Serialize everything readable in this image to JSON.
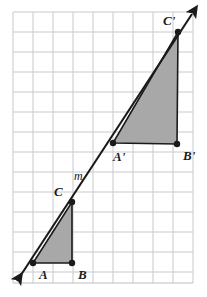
{
  "figure": {
    "canvas": {
      "width": 207,
      "height": 297
    },
    "colors": {
      "grid_line": "#c9c9cf",
      "grid_border": "#bcbcc4",
      "shade_fill": "#a8a8a8",
      "stroke": "#1a1a1a",
      "background": "#ffffff"
    },
    "grid": {
      "x0": 13,
      "y0": 12,
      "cell": 20,
      "cols": 9,
      "rows": 13.55,
      "show_border": true
    },
    "line": {
      "name": "m",
      "label": "m",
      "label_x": 74,
      "label_y": 180,
      "start_x": 17,
      "start_y": 281,
      "end_x": 192,
      "end_y": 14,
      "arrow_both_ends": true,
      "stroke_width": 2.1
    },
    "points": [
      {
        "id": "A",
        "label": "A",
        "x": 33,
        "y": 263,
        "dot": true,
        "label_x": 39,
        "label_y": 279
      },
      {
        "id": "B",
        "label": "B",
        "x": 72,
        "y": 263,
        "dot": true,
        "label_x": 78,
        "label_y": 279
      },
      {
        "id": "C",
        "label": "C",
        "x": 72,
        "y": 202,
        "dot": true,
        "label_x": 54,
        "label_y": 196
      },
      {
        "id": "A'",
        "label": "A'",
        "x": 113,
        "y": 143,
        "dot": true,
        "label_x": 113,
        "label_y": 161
      },
      {
        "id": "B'",
        "label": "B'",
        "x": 177,
        "y": 144,
        "dot": true,
        "label_x": 183,
        "label_y": 160
      },
      {
        "id": "C'",
        "label": "C'",
        "x": 178,
        "y": 32,
        "dot": true,
        "label_x": 163,
        "label_y": 25
      }
    ],
    "triangles": [
      {
        "id": "ABC",
        "name": "triangle-abc",
        "points": "33,263 72,263 72,202",
        "filled": true
      },
      {
        "id": "A'B'C'",
        "name": "triangle-a-prime-b-prime-c-prime",
        "points": "113,143 177,144 178,32",
        "filled": true
      }
    ],
    "dot_radius": 3.2
  }
}
